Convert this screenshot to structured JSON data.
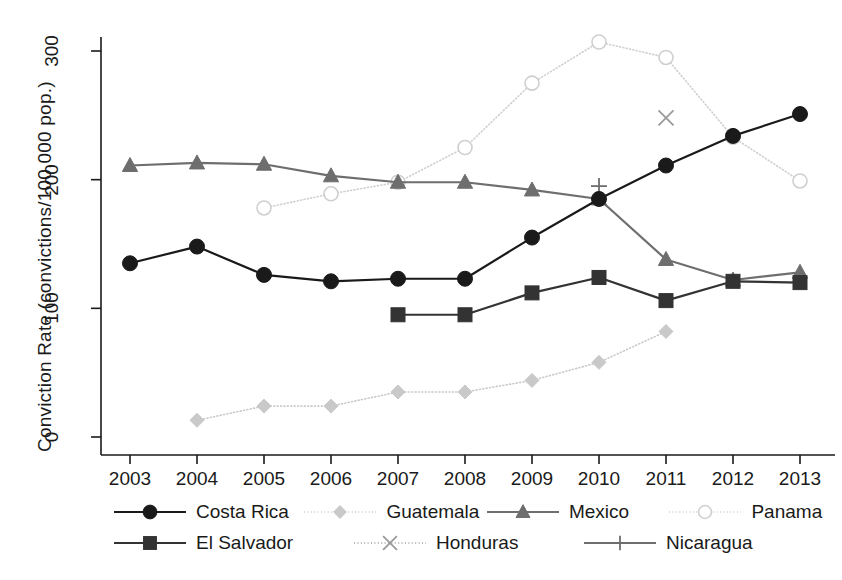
{
  "chart_data": {
    "type": "line",
    "title": "",
    "xlabel": "",
    "ylabel": "Conviction Rate (convictions/100,000 pop.)",
    "categories": [
      "2003",
      "2004",
      "2005",
      "2006",
      "2007",
      "2008",
      "2009",
      "2010",
      "2011",
      "2012",
      "2013"
    ],
    "x": [
      2003,
      2004,
      2005,
      2006,
      2007,
      2008,
      2009,
      2010,
      2011,
      2012,
      2013
    ],
    "xlim": [
      2002.6,
      2013.4
    ],
    "ylim": [
      0,
      320
    ],
    "yticks": [
      0,
      100,
      200,
      300
    ],
    "ytick_labels": [
      "0",
      "100",
      "200",
      "300"
    ],
    "xtick_labels": [
      "2003",
      "2004",
      "2005",
      "2006",
      "2007",
      "2008",
      "2009",
      "2010",
      "2011",
      "2012",
      "2013"
    ],
    "grid": false,
    "legend_position": "bottom",
    "series": [
      {
        "name": "Costa Rica",
        "marker": "filled-circle",
        "color": "#1a1a1a",
        "line_style": "solid",
        "values": [
          135,
          148,
          126,
          121,
          123,
          123,
          155,
          185,
          211,
          234,
          251
        ]
      },
      {
        "name": "El Salvador",
        "marker": "filled-square",
        "color": "#333333",
        "line_style": "solid",
        "values": [
          null,
          null,
          null,
          null,
          95,
          95,
          112,
          124,
          106,
          121,
          120
        ]
      },
      {
        "name": "Guatemala",
        "marker": "filled-diamond",
        "color": "#c9c9c9",
        "line_style": "dotted",
        "values": [
          null,
          13,
          24,
          24,
          35,
          35,
          44,
          58,
          82,
          null,
          null
        ]
      },
      {
        "name": "Honduras",
        "marker": "cross-x",
        "color": "#9a9a9a",
        "line_style": "dotted",
        "values": [
          null,
          null,
          null,
          null,
          null,
          null,
          null,
          null,
          248,
          null,
          null
        ]
      },
      {
        "name": "Mexico",
        "marker": "filled-triangle",
        "color": "#6e6e6e",
        "line_style": "solid",
        "values": [
          211,
          213,
          212,
          203,
          198,
          198,
          192,
          185,
          138,
          122,
          128
        ]
      },
      {
        "name": "Nicaragua",
        "marker": "plus",
        "color": "#6e6e6e",
        "line_style": "solid",
        "values": [
          null,
          null,
          null,
          null,
          null,
          null,
          null,
          195,
          null,
          null,
          null
        ]
      },
      {
        "name": "Panama",
        "marker": "open-circle",
        "color": "#cfcfcf",
        "line_style": "dotted",
        "values": [
          null,
          null,
          178,
          189,
          198,
          225,
          275,
          307,
          295,
          233,
          199
        ]
      }
    ]
  },
  "legend": {
    "rows": [
      [
        {
          "label": "Costa Rica",
          "series": "Costa Rica"
        },
        {
          "label": "Guatemala",
          "series": "Guatemala"
        },
        {
          "label": "Mexico",
          "series": "Mexico"
        },
        {
          "label": "Panama",
          "series": "Panama"
        }
      ],
      [
        {
          "label": "El Salvador",
          "series": "El Salvador"
        },
        {
          "label": "Honduras",
          "series": "Honduras"
        },
        {
          "label": "Nicaragua",
          "series": "Nicaragua"
        }
      ]
    ]
  }
}
